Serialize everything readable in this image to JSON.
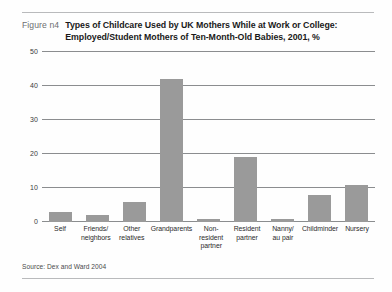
{
  "figure": {
    "number_label": "Figure n4",
    "title_line1": "Types of Childcare Used by UK Mothers While at Work or College:",
    "title_line2": "Employed/Student Mothers of Ten-Month-Old Babies, 2001, %",
    "source": "Source: Dex and Ward 2004"
  },
  "chart_data": {
    "type": "bar",
    "title": "Types of Childcare Used by UK Mothers While at Work or College: Employed/Student Mothers of Ten-Month-Old Babies, 2001, %",
    "xlabel": "",
    "ylabel": "",
    "ylim": [
      0,
      50
    ],
    "yticks": [
      0,
      10,
      20,
      30,
      40,
      50
    ],
    "ytick_labels": [
      "0",
      "10",
      "20",
      "30",
      "40",
      "50"
    ],
    "grid": true,
    "legend": "none",
    "bar_color": "#9a9a9a",
    "categories": [
      "Self",
      "Friends/ neighbors",
      "Other relatives",
      "Grandparents",
      "Non-resident partner",
      "Resident partner",
      "Nanny/ au pair",
      "Childminder",
      "Nursery"
    ],
    "category_lines": [
      [
        "Self",
        ""
      ],
      [
        "Friends/",
        "neighbors"
      ],
      [
        "Other",
        "relatives"
      ],
      [
        "Grandparents",
        ""
      ],
      [
        "Non-resident",
        "partner"
      ],
      [
        "Resident",
        "partner"
      ],
      [
        "Nanny/",
        "au pair"
      ],
      [
        "Childminder",
        ""
      ],
      [
        "Nursery",
        ""
      ]
    ],
    "values": [
      3,
      2,
      6,
      42,
      1,
      19,
      1,
      8,
      11
    ]
  }
}
